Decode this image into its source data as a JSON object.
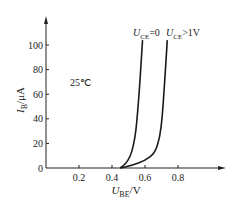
{
  "chart_data": {
    "type": "line",
    "title": "",
    "xlabel": "U_BE/V",
    "ylabel": "I_B/μA",
    "xlabel_main": "U",
    "xlabel_sub": "BE",
    "xlabel_unit": "/V",
    "ylabel_main": "I",
    "ylabel_sub": "B",
    "ylabel_unit": "/μA",
    "xlim": [
      0,
      1.0
    ],
    "ylim": [
      0,
      110
    ],
    "x_ticks": [
      "0.2",
      "0.4",
      "0.6",
      "0.8"
    ],
    "y_ticks": [
      "0",
      "20",
      "40",
      "60",
      "80",
      "100"
    ],
    "annotation": "25℃",
    "grid": false,
    "series": [
      {
        "name": "U_CE=0",
        "label_main": "U",
        "label_sub": "CE",
        "label_rest": "=0",
        "x": [
          0.45,
          0.48,
          0.51,
          0.53,
          0.545,
          0.555,
          0.565,
          0.575,
          0.585
        ],
        "y": [
          0,
          3,
          9,
          18,
          30,
          45,
          62,
          82,
          104
        ]
      },
      {
        "name": "U_CE>1V",
        "label_main": "U",
        "label_sub": "CE",
        "label_rest": ">1V",
        "x": [
          0.45,
          0.52,
          0.6,
          0.66,
          0.69,
          0.705,
          0.715,
          0.725,
          0.735
        ],
        "y": [
          0,
          2,
          6,
          12,
          25,
          42,
          62,
          82,
          104
        ]
      }
    ]
  }
}
